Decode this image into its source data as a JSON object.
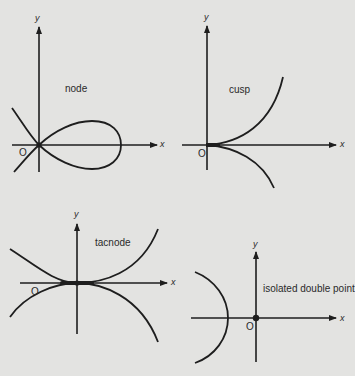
{
  "diagram": {
    "title": "",
    "colors": {
      "background": "#e3e3e1",
      "ink": "#1e1e1e"
    },
    "panels": [
      {
        "id": "node",
        "label": "node",
        "axis_x": "x",
        "axis_y": "y",
        "origin": "O",
        "description": "Two branches crossing at the origin with distinct tangents; a loop to the right"
      },
      {
        "id": "cusp",
        "label": "cusp",
        "axis_x": "x",
        "axis_y": "y",
        "origin": "O",
        "description": "Two branches meeting at origin with a common tangent along the positive x-axis"
      },
      {
        "id": "tacnode",
        "label": "tacnode",
        "axis_x": "x",
        "axis_y": "y",
        "origin": "O",
        "description": "Two curves touching tangentially at the origin, one opening up, one opening down"
      },
      {
        "id": "isolated",
        "label": "isolated double point",
        "axis_x": "x",
        "axis_y": "y",
        "origin": "O",
        "description": "Isolated point at the origin with a separate arc branch to the left"
      }
    ]
  }
}
